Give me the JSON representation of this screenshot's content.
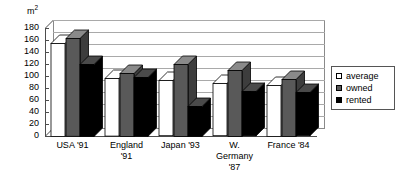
{
  "chart_data": {
    "type": "bar",
    "title": "",
    "subtitle": "",
    "xlabel": "",
    "ylabel": "m2",
    "unit_label": "m",
    "unit_superscript": "2",
    "categories": [
      "USA '91",
      "England '91",
      "Japan '93",
      "W. Germany '87",
      "France '84"
    ],
    "category_lines": [
      [
        "USA '91"
      ],
      [
        "England",
        "'91"
      ],
      [
        "Japan '93"
      ],
      [
        "W.",
        "Germany",
        "'87"
      ],
      [
        "France '84"
      ]
    ],
    "series": [
      {
        "name": "average",
        "color": "#ffffff",
        "values": [
          155,
          96,
          92,
          87,
          85
        ]
      },
      {
        "name": "owned",
        "color": "#595959",
        "values": [
          163,
          105,
          120,
          110,
          95
        ]
      },
      {
        "name": "rented",
        "color": "#000000",
        "values": [
          120,
          98,
          50,
          74,
          72
        ]
      }
    ],
    "ylim": [
      0,
      180
    ],
    "ytick_step": 20,
    "yticks": [
      180,
      160,
      140,
      120,
      100,
      80,
      60,
      40,
      20,
      0
    ],
    "ytick_labels": [
      "180",
      "160",
      "140",
      "120",
      "100",
      "80",
      "60",
      "40",
      "20",
      "0"
    ],
    "grid": true,
    "grid_axis": "y",
    "legend_position": "right",
    "style": "3d-column",
    "legend": {
      "entries": [
        {
          "label": "average",
          "color": "#ffffff"
        },
        {
          "label": "owned",
          "color": "#595959"
        },
        {
          "label": "rented",
          "color": "#000000"
        }
      ]
    },
    "colors": {
      "average": "#ffffff",
      "owned": "#595959",
      "rented": "#000000",
      "grid": "#a9a9a9",
      "axis": "#4d4d4d",
      "outline": "#000000",
      "background": "#ffffff"
    }
  }
}
